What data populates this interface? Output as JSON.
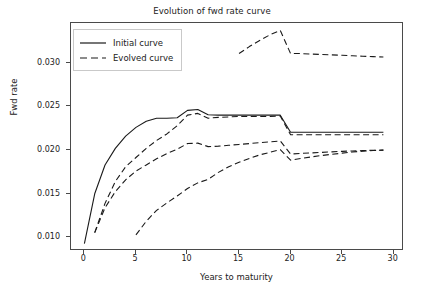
{
  "chart_data": {
    "type": "line",
    "title": "Evolution of fwd rate curve",
    "xlabel": "Years to maturity",
    "ylabel": "Fwd rate",
    "xlim": [
      -1.3,
      31.0
    ],
    "ylim": [
      0.00845,
      0.03455
    ],
    "xticks": [
      0,
      5,
      10,
      15,
      20,
      25,
      30
    ],
    "xtick_labels": [
      "0",
      "5",
      "10",
      "15",
      "20",
      "25",
      "30"
    ],
    "yticks": [
      0.01,
      0.015,
      0.02,
      0.025,
      0.03
    ],
    "ytick_labels": [
      "0.010",
      "0.015",
      "0.020",
      "0.025",
      "0.030"
    ],
    "grid": false,
    "legend_position": "upper left",
    "line_color": "#1a1a1a",
    "series": [
      {
        "name": "Initial curve",
        "style": "solid",
        "x": [
          0,
          1,
          2,
          3,
          4,
          5,
          6,
          7,
          8,
          9,
          10,
          11,
          12,
          13,
          14,
          15,
          16,
          17,
          18,
          19,
          20,
          21,
          22,
          23,
          24,
          25,
          26,
          27,
          28,
          29
        ],
        "values": [
          0.0093,
          0.015,
          0.0183,
          0.0202,
          0.0216,
          0.0226,
          0.0233,
          0.02365,
          0.02365,
          0.0237,
          0.02455,
          0.02465,
          0.02405,
          0.024,
          0.024,
          0.024,
          0.024,
          0.024,
          0.024,
          0.024,
          0.02205,
          0.02205,
          0.02205,
          0.02205,
          0.02205,
          0.02205,
          0.02205,
          0.02205,
          0.02205,
          0.02205
        ]
      },
      {
        "name": "Evolved curve",
        "style": "dashed",
        "x": [
          1,
          2,
          3,
          4,
          5,
          6,
          7,
          8,
          9,
          10,
          11,
          12,
          13,
          14,
          15,
          16,
          17,
          18,
          19,
          20,
          21,
          22,
          23,
          24,
          25,
          26,
          27,
          28,
          29
        ],
        "values": [
          0.01055,
          0.0139,
          0.0164,
          0.0181,
          0.01915,
          0.0202,
          0.0211,
          0.02185,
          0.0228,
          0.024,
          0.0242,
          0.02365,
          0.02375,
          0.0238,
          0.02385,
          0.02385,
          0.02385,
          0.02385,
          0.0239,
          0.02175,
          0.02175,
          0.02175,
          0.02175,
          0.02175,
          0.02175,
          0.02175,
          0.02175,
          0.02175,
          0.02175
        ]
      },
      {
        "name": "Evolved curve",
        "style": "dashed",
        "x": [
          1,
          2,
          3,
          4,
          5,
          6,
          7,
          8,
          9,
          10,
          11,
          12,
          13,
          14,
          15,
          16,
          17,
          18,
          19,
          20,
          21,
          22,
          23,
          24,
          25,
          26,
          27,
          28,
          29
        ],
        "values": [
          0.01055,
          0.0134,
          0.01525,
          0.0166,
          0.0176,
          0.0183,
          0.019,
          0.0196,
          0.0201,
          0.02075,
          0.0208,
          0.0204,
          0.02045,
          0.02055,
          0.02065,
          0.02075,
          0.02085,
          0.02095,
          0.02105,
          0.01955,
          0.01962,
          0.01968,
          0.01974,
          0.0198,
          0.01986,
          0.0199,
          0.01994,
          0.01998,
          0.02
        ]
      },
      {
        "name": "Evolved curve",
        "style": "dashed",
        "x": [
          5,
          6,
          7,
          8,
          9,
          10,
          11,
          12,
          13,
          14,
          15,
          16,
          17,
          18,
          19,
          20,
          21,
          22,
          23,
          24,
          25,
          26,
          27,
          28,
          29
        ],
        "values": [
          0.0103,
          0.01185,
          0.0131,
          0.01395,
          0.01475,
          0.0156,
          0.01625,
          0.01665,
          0.01745,
          0.0181,
          0.0186,
          0.01905,
          0.01945,
          0.01975,
          0.02005,
          0.01885,
          0.01905,
          0.01922,
          0.01938,
          0.01952,
          0.01965,
          0.01978,
          0.01988,
          0.01995,
          0.02
        ]
      },
      {
        "name": "Evolved curve",
        "style": "dashed",
        "x": [
          15,
          16,
          17,
          18,
          19,
          20,
          21,
          22,
          23,
          24,
          25,
          26,
          27,
          28,
          29
        ],
        "values": [
          0.03105,
          0.03185,
          0.03255,
          0.0332,
          0.0337,
          0.03105,
          0.03105,
          0.031,
          0.03095,
          0.0309,
          0.03085,
          0.0308,
          0.03075,
          0.0307,
          0.03065
        ]
      }
    ]
  },
  "legend": {
    "entries": [
      {
        "label": "Initial curve",
        "style": "solid"
      },
      {
        "label": "Evolved curve",
        "style": "dashed"
      }
    ]
  }
}
